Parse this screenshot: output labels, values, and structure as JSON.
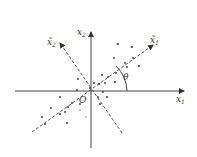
{
  "diagram": {
    "title": "",
    "axes": {
      "x1": {
        "label": "x",
        "subscript": "1"
      },
      "x2": {
        "label": "x",
        "subscript": "2"
      },
      "x1_tilde": {
        "label": "x̃",
        "subscript": "1"
      },
      "x2_tilde": {
        "label": "x̃",
        "subscript": "2"
      }
    },
    "origin_label": "O",
    "angle_label": "θ",
    "colors": {
      "axis": "#333333",
      "dashed": "#555555",
      "point": "#333333",
      "faint_point": "#bbbbbb"
    },
    "points": [
      [
        118,
        44
      ],
      [
        132,
        47
      ],
      [
        114,
        58
      ],
      [
        133,
        58
      ],
      [
        125,
        63
      ],
      [
        139,
        66
      ],
      [
        116,
        73
      ],
      [
        127,
        67
      ],
      [
        102,
        75
      ],
      [
        108,
        77
      ],
      [
        78,
        79
      ],
      [
        99,
        84
      ],
      [
        105,
        83
      ],
      [
        115,
        82
      ],
      [
        94,
        83
      ],
      [
        90,
        88
      ],
      [
        103,
        92
      ],
      [
        107,
        97
      ],
      [
        77,
        90
      ],
      [
        60,
        97
      ],
      [
        72,
        103
      ],
      [
        68,
        107
      ],
      [
        51,
        108
      ],
      [
        65,
        112
      ],
      [
        60,
        114
      ],
      [
        42,
        117
      ],
      [
        45,
        124
      ],
      [
        67,
        123
      ],
      [
        100,
        104
      ],
      [
        98,
        97
      ],
      [
        80,
        104
      ]
    ],
    "faint_points": [
      [
        117,
        44
      ],
      [
        131,
        47
      ],
      [
        80,
        110
      ],
      [
        86,
        117
      ]
    ]
  }
}
